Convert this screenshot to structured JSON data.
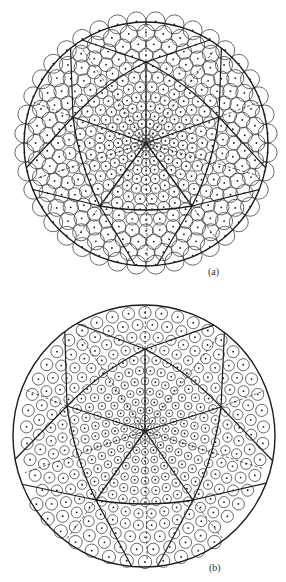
{
  "figure": {
    "panels": [
      {
        "id": "a",
        "label": "(a)",
        "label_pos": [
          208,
          266
        ],
        "center": [
          146,
          144
        ],
        "radius": 122,
        "hub": [
          146,
          143
        ],
        "pentagon": [
          [
            146,
            62
          ],
          [
            219,
            117
          ],
          [
            192,
            206
          ],
          [
            100,
            206
          ],
          [
            73,
            117
          ]
        ],
        "rim_points_deg": [
          -108,
          -36,
          36,
          108,
          180
        ],
        "small_r": 4.2,
        "large_r": 9.5,
        "overhang": true,
        "style": "dense"
      },
      {
        "id": "b",
        "label": "(b)",
        "label_pos": [
          209,
          562
        ],
        "center": [
          144,
          436
        ],
        "radius": 131,
        "hub": [
          145,
          431
        ],
        "pentagon": [
          [
            145,
            349
          ],
          [
            221,
            407
          ],
          [
            193,
            500
          ],
          [
            96,
            500
          ],
          [
            67,
            406
          ]
        ],
        "rim_points_deg": [
          -108,
          -36,
          36,
          108,
          180
        ],
        "small_r": 4.3,
        "large_r": 8.5,
        "overhang": false,
        "style": "separated"
      }
    ],
    "colors": {
      "line": "#1a1a1a",
      "circle": "#2a2a2a",
      "dash": "#333333",
      "background": "#ffffff"
    }
  }
}
